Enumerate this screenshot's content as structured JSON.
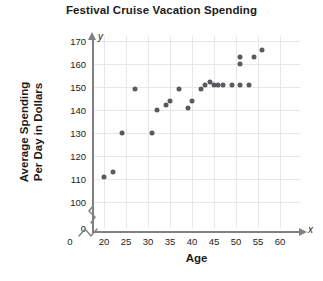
{
  "chart_data": {
    "type": "scatter",
    "title": "Festival Cruise Vacation Spending",
    "xlabel": "Age",
    "ylabel_line1": "Average Spending",
    "ylabel_line2": "Per Day in Dollars",
    "x_axis_letter": "x",
    "y_axis_letter": "y",
    "xlim": [
      17.5,
      64
    ],
    "ylim": [
      96,
      173
    ],
    "x_ticks": [
      0,
      20,
      25,
      30,
      35,
      40,
      45,
      50,
      55,
      60
    ],
    "y_ticks": [
      0,
      100,
      110,
      120,
      130,
      140,
      150,
      160,
      170
    ],
    "axis_break_x": true,
    "axis_break_y": true,
    "grid": true,
    "grid_color": "#e8e8e8",
    "point_color": "#5a5a5e",
    "points": [
      {
        "x": 20,
        "y": 111
      },
      {
        "x": 22,
        "y": 113
      },
      {
        "x": 24,
        "y": 130
      },
      {
        "x": 27,
        "y": 149
      },
      {
        "x": 31,
        "y": 130
      },
      {
        "x": 32,
        "y": 140
      },
      {
        "x": 34,
        "y": 142
      },
      {
        "x": 35,
        "y": 144
      },
      {
        "x": 37,
        "y": 149
      },
      {
        "x": 39,
        "y": 141
      },
      {
        "x": 40,
        "y": 144
      },
      {
        "x": 42,
        "y": 149
      },
      {
        "x": 43,
        "y": 151
      },
      {
        "x": 44,
        "y": 152
      },
      {
        "x": 45,
        "y": 151
      },
      {
        "x": 46,
        "y": 151
      },
      {
        "x": 47,
        "y": 151
      },
      {
        "x": 49,
        "y": 151
      },
      {
        "x": 51,
        "y": 151
      },
      {
        "x": 51,
        "y": 163
      },
      {
        "x": 51,
        "y": 160
      },
      {
        "x": 53,
        "y": 151
      },
      {
        "x": 54,
        "y": 163
      },
      {
        "x": 56,
        "y": 166
      }
    ]
  }
}
